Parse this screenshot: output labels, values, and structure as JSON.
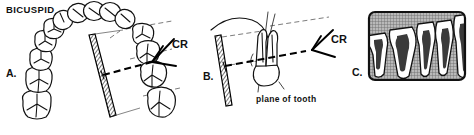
{
  "figure": {
    "title": "BICUSPID",
    "background_color": "#ffffff",
    "ink_color": "#111111",
    "panels": [
      {
        "id": "A",
        "letter": "A.",
        "caption": "",
        "view": "occlusal view of dental arch with film placement and central ray",
        "labels": [
          {
            "name": "central-ray",
            "text": "CR"
          }
        ],
        "elements": {
          "tooth_count": 13,
          "film": "hatched radiographic film packet, tilted",
          "central_ray": "bold dashed arrow striking film",
          "guide_lines": "thin dashed long-axis guides"
        }
      },
      {
        "id": "B",
        "letter": "B.",
        "caption": "plane of tooth",
        "view": "detail: single bicuspid, film plane and central ray geometry",
        "labels": [
          {
            "name": "central-ray",
            "text": "CR"
          },
          {
            "name": "plane-of-tooth",
            "text": "plane of tooth"
          }
        ],
        "elements": {
          "tooth_count": 1,
          "film": "hatched radiographic film packet, tilted",
          "central_ray": "bold dashed ray to CR bisector",
          "guide_lines": "thin dashed plane-of-film and plane-of-tooth lines"
        }
      },
      {
        "id": "C",
        "letter": "C.",
        "caption": "",
        "view": "resulting radiograph of bicuspid region",
        "labels": [],
        "elements": {
          "tooth_count": 5,
          "background": "cross-hatched gray radiograph field",
          "frame": "rounded rectangle border"
        }
      }
    ],
    "colors": {
      "ink": "#111111",
      "paper": "#ffffff",
      "film_hatch": "#555555",
      "radiograph_field": "#8f8f8f"
    }
  }
}
